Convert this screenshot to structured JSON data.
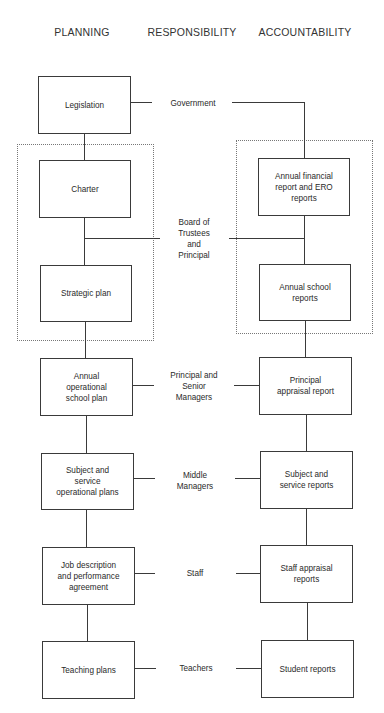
{
  "columns": {
    "planning": "PLANNING",
    "responsibility": "RESPONSIBILITY",
    "accountability": "ACCOUNTABILITY"
  },
  "levels": [
    {
      "planning": "Legislation",
      "responsibility": "Government",
      "accountability": "Annual financial\nreport and ERO\nreports"
    },
    {
      "planning": "Charter",
      "responsibility": "Board of\nTrustees\nand\nPrincipal",
      "accountability": "Annual school\nreports"
    },
    {
      "planning": "Strategic plan"
    },
    {
      "planning": "Annual\noperational\nschool plan",
      "responsibility": "Principal and\nSenior\nManagers",
      "accountability": "Principal\nappraisal report"
    },
    {
      "planning": "Subject and\nservice\noperational plans",
      "responsibility": "Middle\nManagers",
      "accountability": "Subject and\nservice reports"
    },
    {
      "planning": "Job description\nand performance\nagreement",
      "responsibility": "Staff",
      "accountability": "Staff appraisal\nreports"
    },
    {
      "planning": "Teaching plans",
      "responsibility": "Teachers",
      "accountability": "Student reports"
    }
  ],
  "caption": "Figure: Planning, responsibility and accountability framework"
}
